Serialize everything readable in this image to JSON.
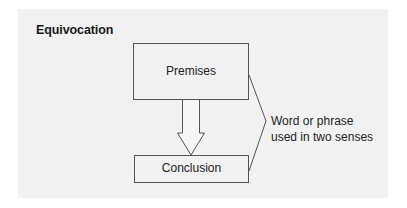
{
  "title": "Equivocation",
  "diagram": {
    "premises_label": "Premises",
    "conclusion_label": "Conclusion",
    "note_line1": "Word or phrase",
    "note_line2": "used in two senses",
    "colors": {
      "panel_background": "#f1f1f1",
      "stroke": "#555555",
      "text": "#222222"
    }
  }
}
